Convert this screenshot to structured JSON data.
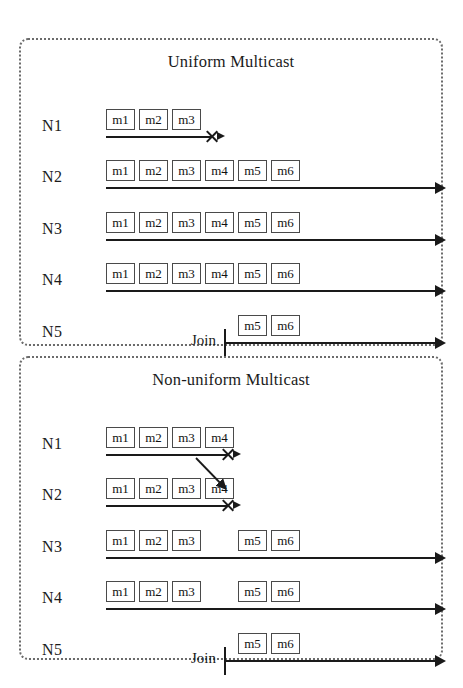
{
  "figure": {
    "panels": [
      {
        "id": "uniform",
        "title": "Uniform Multicast",
        "rows": [
          {
            "label": "N1",
            "messages": [
              "m1",
              "m2",
              "m3"
            ],
            "message_slots": [
              0,
              1,
              2
            ],
            "timeline": {
              "start": 85,
              "end": 190,
              "arrow": "small",
              "crash": true,
              "crash_x": 190
            },
            "join": null
          },
          {
            "label": "N2",
            "messages": [
              "m1",
              "m2",
              "m3",
              "m4",
              "m5",
              "m6"
            ],
            "message_slots": [
              0,
              1,
              2,
              3,
              4,
              5
            ],
            "timeline": {
              "start": 85,
              "end": 414,
              "arrow": "full",
              "crash": false
            },
            "join": null
          },
          {
            "label": "N3",
            "messages": [
              "m1",
              "m2",
              "m3",
              "m4",
              "m5",
              "m6"
            ],
            "message_slots": [
              0,
              1,
              2,
              3,
              4,
              5
            ],
            "timeline": {
              "start": 85,
              "end": 414,
              "arrow": "full",
              "crash": false
            },
            "join": null
          },
          {
            "label": "N4",
            "messages": [
              "m1",
              "m2",
              "m3",
              "m4",
              "m5",
              "m6"
            ],
            "message_slots": [
              0,
              1,
              2,
              3,
              4,
              5
            ],
            "timeline": {
              "start": 85,
              "end": 414,
              "arrow": "full",
              "crash": false
            },
            "join": null
          },
          {
            "label": "N5",
            "messages": [
              "m5",
              "m6"
            ],
            "message_slots": [
              4,
              5
            ],
            "timeline": {
              "start": 203,
              "end": 414,
              "arrow": "full",
              "crash": false
            },
            "join": {
              "label": "Join",
              "tick_x": 203
            }
          }
        ]
      },
      {
        "id": "nonuniform",
        "title": "Non-uniform Multicast",
        "rows": [
          {
            "label": "N1",
            "messages": [
              "m1",
              "m2",
              "m3",
              "m4"
            ],
            "message_slots": [
              0,
              1,
              2,
              3
            ],
            "timeline": {
              "start": 85,
              "end": 206,
              "arrow": "small",
              "crash": true,
              "crash_x": 206
            },
            "join": null
          },
          {
            "label": "N2",
            "messages": [
              "m1",
              "m2",
              "m3",
              "m4"
            ],
            "message_slots": [
              0,
              1,
              2,
              3
            ],
            "timeline": {
              "start": 85,
              "end": 206,
              "arrow": "small",
              "crash": true,
              "crash_x": 206
            },
            "join": null
          },
          {
            "label": "N3",
            "messages": [
              "m1",
              "m2",
              "m3",
              "m5",
              "m6"
            ],
            "message_slots": [
              0,
              1,
              2,
              4,
              5
            ],
            "timeline": {
              "start": 85,
              "end": 414,
              "arrow": "full",
              "crash": false
            },
            "join": null
          },
          {
            "label": "N4",
            "messages": [
              "m1",
              "m2",
              "m3",
              "m5",
              "m6"
            ],
            "message_slots": [
              0,
              1,
              2,
              4,
              5
            ],
            "timeline": {
              "start": 85,
              "end": 414,
              "arrow": "full",
              "crash": false
            },
            "join": null
          },
          {
            "label": "N5",
            "messages": [
              "m5",
              "m6"
            ],
            "message_slots": [
              4,
              5
            ],
            "timeline": {
              "start": 203,
              "end": 414,
              "arrow": "full",
              "crash": false
            },
            "join": {
              "label": "Join",
              "tick_x": 203
            }
          }
        ],
        "delivery_arrow": {
          "from_x": 175,
          "from_y": 100,
          "to_x": 205,
          "to_y": 131
        }
      }
    ],
    "layout": {
      "slot_origin": 85,
      "slot_pitch": 33,
      "box_width": 29,
      "row_tops": [
        65,
        116,
        168,
        219,
        271
      ]
    },
    "colors": {
      "ink": "#1a1a1a",
      "border": "#6b6b6b",
      "box_border": "#4a4a4a",
      "background": "#ffffff"
    }
  }
}
